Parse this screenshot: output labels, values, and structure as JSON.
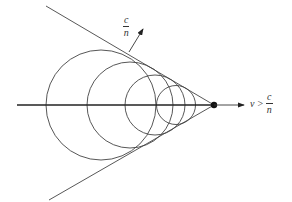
{
  "diagram": {
    "wave_speed_label": {
      "numerator": "c",
      "denominator": "n"
    },
    "particle_speed_label": {
      "variable": "v",
      "relation": ">",
      "numerator": "c",
      "denominator": "n"
    },
    "circles_count": 4,
    "colors": {
      "stroke": "#333333",
      "background": "#ffffff"
    }
  }
}
